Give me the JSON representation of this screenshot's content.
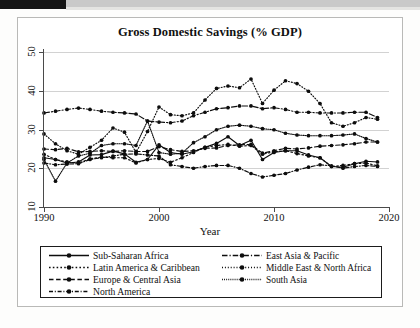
{
  "figure": {
    "title": "Gross Domestic Savings (% GDP)",
    "x_axis_title": "Year"
  },
  "axes": {
    "y_ticks": [
      "10",
      "20",
      "30",
      "40",
      "50"
    ],
    "x_ticks": [
      "1990",
      "2000",
      "2010",
      "2020"
    ]
  },
  "legend": {
    "left": [
      {
        "label": "Sub-Saharan Africa",
        "key": "solid-line-marker"
      },
      {
        "label": "Latin America & Caribbean",
        "key": "dotted-line-marker"
      },
      {
        "label": "Europe & Central Asia",
        "key": "dashed-line-marker"
      },
      {
        "label": "North America",
        "key": "dash-dot-line-marker"
      }
    ],
    "right": [
      {
        "label": "East Asia & Pacific",
        "key": "long-dash-dot-line-marker"
      },
      {
        "label": "Middle East & North Africa",
        "key": "fine-dotted-line-marker"
      },
      {
        "label": "South Asia",
        "key": "dense-dotted-line-marker"
      }
    ]
  },
  "chart_data": {
    "type": "line",
    "title": "Gross Domestic Savings (% GDP)",
    "xlabel": "Year",
    "ylabel": "",
    "xlim": [
      1990,
      2020
    ],
    "ylim": [
      8,
      52
    ],
    "yticks": [
      10,
      20,
      30,
      40,
      50
    ],
    "xticks": [
      1990,
      2000,
      2010,
      2020
    ],
    "grid": "horizontal",
    "legend_position": "below-plot",
    "x": [
      1990,
      1991,
      1992,
      1993,
      1994,
      1995,
      1996,
      1997,
      1998,
      1999,
      2000,
      2001,
      2002,
      2003,
      2004,
      2005,
      2006,
      2007,
      2008,
      2009,
      2010,
      2011,
      2012,
      2013,
      2014,
      2015,
      2016,
      2017,
      2018,
      2019
    ],
    "series": [
      {
        "name": "Sub-Saharan Africa",
        "dash": "solid",
        "values": [
          21.5,
          21.0,
          20.0,
          20.3,
          22.3,
          22.4,
          23.4,
          22.6,
          20.2,
          21.0,
          25.2,
          23.0,
          22.5,
          23.2,
          24.5,
          25.6,
          27.5,
          25.0,
          26.5,
          21.0,
          23.0,
          23.5,
          23.5,
          22.3,
          21.5,
          19.0,
          18.8,
          19.8,
          20.5,
          20.3
        ]
      },
      {
        "name": "Latin America & Caribbean",
        "dash": "dotted",
        "values": [
          22.5,
          21.0,
          20.3,
          20.0,
          21.2,
          21.7,
          21.5,
          21.5,
          20.0,
          21.0,
          21.3,
          20.2,
          21.5,
          23.0,
          24.5,
          25.0,
          25.3,
          24.8,
          25.0,
          22.5,
          23.2,
          23.5,
          22.7,
          22.0,
          21.5,
          19.0,
          19.3,
          19.8,
          20.0,
          19.2
        ]
      },
      {
        "name": "Europe & Central Asia",
        "dash": "dashed",
        "values": [
          24.0,
          23.8,
          24.2,
          23.2,
          23.3,
          23.5,
          23.3,
          23.5,
          23.3,
          23.3,
          24.7,
          23.8,
          23.3,
          23.5,
          24.2,
          24.3,
          25.0,
          25.2,
          25.3,
          22.8,
          23.5,
          24.2,
          24.0,
          24.3,
          24.8,
          25.0,
          25.2,
          25.5,
          26.0,
          26.0
        ]
      },
      {
        "name": "North America",
        "dash": "dash-dot",
        "values": [
          20.0,
          19.5,
          19.7,
          19.8,
          21.0,
          21.5,
          22.0,
          22.5,
          22.6,
          22.3,
          22.0,
          19.5,
          19.0,
          18.5,
          19.0,
          19.3,
          19.3,
          18.5,
          17.0,
          16.0,
          16.5,
          17.0,
          18.0,
          18.8,
          19.5,
          19.2,
          18.5,
          19.0,
          19.3,
          19.0
        ]
      },
      {
        "name": "East Asia & Pacific",
        "dash": "long-dash-dot",
        "values": [
          34.3,
          34.8,
          35.3,
          35.7,
          35.3,
          34.8,
          34.5,
          34.3,
          34.0,
          32.0,
          31.7,
          31.5,
          32.0,
          33.5,
          34.5,
          35.5,
          35.8,
          36.3,
          36.3,
          35.5,
          35.8,
          35.3,
          34.5,
          34.5,
          34.3,
          34.3,
          34.3,
          34.5,
          34.5,
          33.0
        ]
      },
      {
        "name": "Middle East & North Africa",
        "dash": "fine-dotted",
        "values": [
          28.3,
          25.5,
          23.5,
          22.5,
          24.5,
          26.5,
          30.0,
          28.8,
          23.0,
          29.0,
          36.0,
          33.8,
          33.5,
          34.3,
          38.0,
          41.3,
          42.0,
          41.5,
          44.0,
          37.0,
          40.8,
          43.5,
          42.7,
          40.5,
          37.0,
          31.5,
          30.5,
          31.5,
          33.0,
          32.5
        ]
      },
      {
        "name": "South Asia",
        "dash": "dense-dotted",
        "values": [
          21.0,
          14.8,
          20.0,
          22.0,
          22.8,
          25.0,
          25.5,
          25.5,
          25.0,
          32.0,
          23.0,
          22.5,
          22.8,
          25.8,
          27.5,
          29.5,
          30.5,
          30.8,
          30.5,
          29.8,
          29.5,
          28.5,
          28.0,
          27.8,
          27.8,
          27.8,
          28.0,
          28.3,
          27.0,
          26.0
        ]
      }
    ]
  }
}
